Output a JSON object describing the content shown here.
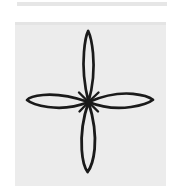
{
  "page": {
    "background_color": "#ffffff"
  },
  "artifact": {
    "name": "scanner streak band",
    "color": "#e2e2e2",
    "x": 17,
    "y": 2,
    "width": 150,
    "height": 4
  },
  "panel": {
    "name": "paper panel",
    "background_color": "#ececec",
    "edge_color": "#e4e4e4",
    "x": 15,
    "y": 22,
    "width": 151,
    "height": 164
  },
  "drawing": {
    "name": "four-petal flower",
    "description": "Hand-drawn cross-shaped flower with four narrow pointed petals radiating from a central point",
    "ink_color": "#1a1a1a",
    "stroke_width": 2.6,
    "petal_count": 4,
    "center": {
      "x": 73,
      "y": 80
    },
    "petals": [
      {
        "name": "top-petal",
        "direction": "up",
        "tip": {
          "x": 73,
          "y": 9
        },
        "max_half_width": 7,
        "length": 71
      },
      {
        "name": "right-petal",
        "direction": "right",
        "tip": {
          "x": 138,
          "y": 78
        },
        "max_half_width": 9,
        "length": 65
      },
      {
        "name": "bottom-petal",
        "direction": "down",
        "tip": {
          "x": 73,
          "y": 150
        },
        "max_half_width": 9,
        "length": 70
      },
      {
        "name": "left-petal",
        "direction": "left",
        "tip": {
          "x": 12,
          "y": 78
        },
        "max_half_width": 9,
        "length": 61
      }
    ]
  }
}
